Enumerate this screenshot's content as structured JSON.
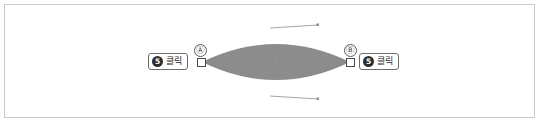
{
  "figure": {
    "title": "",
    "canvas_width": 540,
    "canvas_height": 124,
    "background_color": "#ffffff",
    "frame_color": "#c9c9c9"
  },
  "shape": {
    "name": "lens-vesica-shape",
    "fill_color": "#8c8c8c",
    "left_tip_x": 202,
    "right_tip_x": 350,
    "center_y": 62,
    "top_y": 26,
    "bottom_y": 98
  },
  "markers": [
    {
      "id": "a",
      "label": "Ⓐ",
      "handle_name": "anchor-handle-a"
    },
    {
      "id": "b",
      "label": "Ⓑ",
      "handle_name": "anchor-handle-b"
    }
  ],
  "callouts": [
    {
      "id": "left",
      "step": "5",
      "text": "클릭"
    },
    {
      "id": "right",
      "step": "5",
      "text": "클릭"
    }
  ],
  "leader_lines": [
    {
      "id": "top",
      "from_x": 270,
      "from_y": 28,
      "to_x": 318,
      "to_y": 25
    },
    {
      "from_note": ""
    },
    {
      "id": "bottom",
      "from_x": 270,
      "from_y": 96,
      "to_x": 318,
      "to_y": 99
    }
  ]
}
